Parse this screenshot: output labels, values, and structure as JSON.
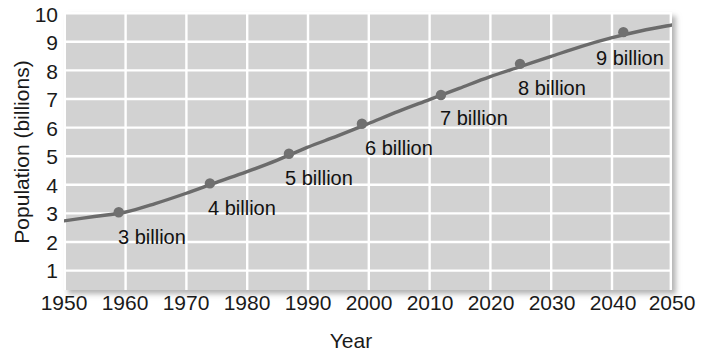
{
  "chart_data": {
    "type": "line",
    "title": "",
    "xlabel": "Year",
    "ylabel": "Population (billions)",
    "xlim": [
      1950,
      2050
    ],
    "ylim": [
      0.35,
      10.0
    ],
    "grid": true,
    "legend": "none",
    "x_ticks": [
      1950,
      1960,
      1970,
      1980,
      1990,
      2000,
      2010,
      2020,
      2030,
      2040,
      2050
    ],
    "y_ticks": [
      1,
      2,
      3,
      4,
      5,
      6,
      7,
      8,
      9,
      10
    ],
    "series": [
      {
        "name": "World population",
        "color": "#6b6b6b",
        "x": [
          1950,
          1955,
          1960,
          1965,
          1970,
          1975,
          1980,
          1985,
          1990,
          1995,
          2000,
          2005,
          2010,
          2015,
          2020,
          2025,
          2030,
          2035,
          2040,
          2045,
          2050
        ],
        "values": [
          2.75,
          2.9,
          3.05,
          3.35,
          3.7,
          4.08,
          4.45,
          4.85,
          5.3,
          5.7,
          6.12,
          6.55,
          6.95,
          7.35,
          7.75,
          8.1,
          8.45,
          8.8,
          9.1,
          9.35,
          9.55
        ]
      }
    ],
    "markers": [
      {
        "label": "3 billion",
        "year": 1959,
        "value": 3.05
      },
      {
        "label": "4 billion",
        "year": 1974,
        "value": 4.05
      },
      {
        "label": "5 billion",
        "year": 1987,
        "value": 5.08
      },
      {
        "label": "6 billion",
        "year": 1999,
        "value": 6.12
      },
      {
        "label": "7 billion",
        "year": 2012,
        "value": 7.12
      },
      {
        "label": "8 billion",
        "year": 2025,
        "value": 8.2
      },
      {
        "label": "9 billion",
        "year": 2042,
        "value": 9.3
      }
    ],
    "annotations": [
      {
        "text": "3 billion",
        "x_px": 118,
        "y_px": 227
      },
      {
        "text": "4 billion",
        "x_px": 208,
        "y_px": 198
      },
      {
        "text": "5 billion",
        "x_px": 285,
        "y_px": 168
      },
      {
        "text": "6 billion",
        "x_px": 365,
        "y_px": 138
      },
      {
        "text": "7 billion",
        "x_px": 440,
        "y_px": 108
      },
      {
        "text": "8 billion",
        "x_px": 518,
        "y_px": 78
      },
      {
        "text": "9 billion",
        "x_px": 596,
        "y_px": 48
      }
    ],
    "colors": {
      "plot_background": "#d2d2d2",
      "gridline": "#ffffff",
      "line": "#6b6b6b",
      "marker": "#707070",
      "text": "#1a1a1a",
      "page_background": "#ffffff"
    }
  },
  "axes": {
    "y_title": "Population (billions)",
    "x_title": "Year",
    "y_tick_labels": [
      "10",
      "9",
      "8",
      "7",
      "6",
      "5",
      "4",
      "3",
      "2",
      "1"
    ],
    "x_tick_labels": [
      "1950",
      "1960",
      "1970",
      "1980",
      "1990",
      "2000",
      "2010",
      "2020",
      "2030",
      "2040",
      "2050"
    ]
  }
}
